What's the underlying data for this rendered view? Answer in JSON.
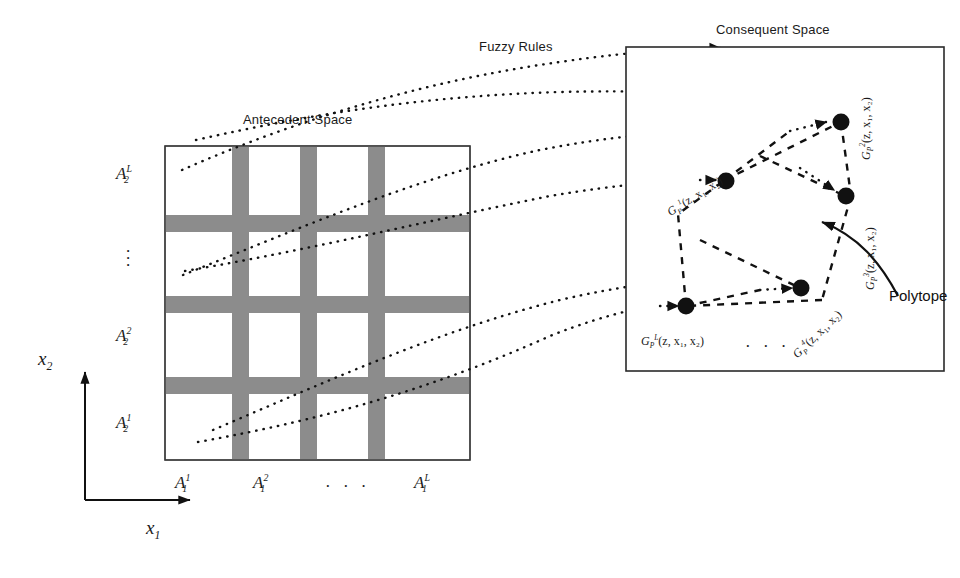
{
  "figure": {
    "titles": {
      "antecedent": "Antecedent Space",
      "consequent": "Consequent Space",
      "fuzzy_rules": "Fuzzy Rules"
    },
    "annotation": {
      "polytope": "Polytope"
    }
  },
  "axes": {
    "x1": "x",
    "x1_sub": "1",
    "x2": "x",
    "x2_sub": "2"
  },
  "antecedent": {
    "grid": {
      "rows": 4,
      "cols": 4,
      "band_color": "#8c8c8c",
      "cell_color": "#ffffff",
      "border_color": "#3a3a3a"
    },
    "x_labels": [
      {
        "base": "A",
        "sub": "1",
        "sup": "1"
      },
      {
        "base": "A",
        "sub": "1",
        "sup": "2"
      },
      {
        "base": "A",
        "sub": "1",
        "sup": "L"
      }
    ],
    "x_ellipsis": "· · ·",
    "y_labels": [
      {
        "base": "A",
        "sub": "2",
        "sup": "L"
      },
      {
        "base": "A",
        "sub": "2",
        "sup": "2"
      },
      {
        "base": "A",
        "sub": "2",
        "sup": "1"
      }
    ],
    "y_ellipsis": "⋮"
  },
  "consequent": {
    "args": "(z, x",
    "args_sub1": "1",
    "args_mid": ", x",
    "args_sub2": "2",
    "args_close": ")",
    "vertex_labels": [
      {
        "base": "G",
        "sub": "P",
        "sup": "1",
        "args": "(z, x₁, x₂)"
      },
      {
        "base": "G",
        "sub": "P",
        "sup": "2",
        "args": "(z, x₁, x₂)"
      },
      {
        "base": "G",
        "sub": "P",
        "sup": "3",
        "args": "(z, x₁, x₂)"
      },
      {
        "base": "G",
        "sub": "P",
        "sup": "4",
        "args": "(z, x₁, x₂)"
      },
      {
        "base": "G",
        "sub": "P",
        "sup": "L",
        "args": "(z, x₁, x₂)"
      }
    ],
    "bottom_ellipsis": "· · ·"
  },
  "colors": {
    "ink": "#1a1a1a",
    "band_gray": "#8c8c8c",
    "box_border": "#3a3a3a",
    "dot_fill": "#111111"
  }
}
